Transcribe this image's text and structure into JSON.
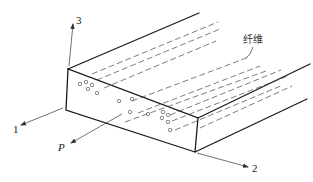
{
  "figure": {
    "labels": {
      "axis_1": "1",
      "axis_2": "2",
      "axis_3": "3",
      "load": "P",
      "fiber": "纤维"
    },
    "colors": {
      "line": "#1a1a1a",
      "background": "#ffffff"
    },
    "fiber_cross_sections": 19
  }
}
